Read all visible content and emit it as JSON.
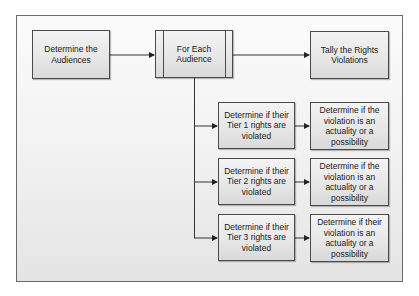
{
  "diagram": {
    "type": "flowchart",
    "nodes": [
      {
        "id": "determine_audiences",
        "label": "Determine the Audiences",
        "shape": "process"
      },
      {
        "id": "for_each_audience",
        "label": "For Each Audience",
        "shape": "predefined-process"
      },
      {
        "id": "tally_violations",
        "label": "Tally the Rights Violations",
        "shape": "process"
      },
      {
        "id": "tier1",
        "label": "Determine if their Tier 1 rights are violated",
        "shape": "process"
      },
      {
        "id": "tier1_actuality",
        "label": "Determine if the violation is an actuality or a possibility",
        "shape": "process"
      },
      {
        "id": "tier2",
        "label": "Determine if their Tier 2 rights are violated",
        "shape": "process"
      },
      {
        "id": "tier2_actuality",
        "label": "Determine if the violation is an actuality or a possibility",
        "shape": "process"
      },
      {
        "id": "tier3",
        "label": "Determine if their Tier 3 rights are violated",
        "shape": "process"
      },
      {
        "id": "tier3_actuality",
        "label": "Determine if their violation is an actuality or a possibility",
        "shape": "process"
      }
    ],
    "edges": [
      {
        "from": "determine_audiences",
        "to": "for_each_audience"
      },
      {
        "from": "for_each_audience",
        "to": "tally_violations"
      },
      {
        "from": "for_each_audience",
        "to": "tier1"
      },
      {
        "from": "for_each_audience",
        "to": "tier2"
      },
      {
        "from": "for_each_audience",
        "to": "tier3"
      },
      {
        "from": "tier1",
        "to": "tier1_actuality"
      },
      {
        "from": "tier2",
        "to": "tier2_actuality"
      },
      {
        "from": "tier3",
        "to": "tier3_actuality"
      }
    ]
  },
  "boxes": {
    "determine_audiences": {
      "lines": [
        "Determine the",
        "Audiences"
      ]
    },
    "for_each_audience": {
      "lines": [
        "For Each",
        "Audience"
      ]
    },
    "tally_violations": {
      "lines": [
        "Tally the Rights",
        "Violations"
      ]
    },
    "tier1": {
      "lines": [
        "Determine if their",
        "Tier 1 rights are",
        "violated"
      ]
    },
    "tier1_actuality": {
      "lines": [
        "Determine if the",
        "violation is an",
        "actuality or a",
        "possibility"
      ]
    },
    "tier2": {
      "lines": [
        "Determine if their",
        "Tier 2 rights are",
        "violated"
      ]
    },
    "tier2_actuality": {
      "lines": [
        "Determine if the",
        "violation is an",
        "actuality or a",
        "possibility"
      ]
    },
    "tier3": {
      "lines": [
        "Determine if their",
        "Tier 3 rights are",
        "violated"
      ]
    },
    "tier3_actuality": {
      "lines": [
        "Determine if their",
        "violation is an",
        "actuality or a",
        "possibility"
      ]
    }
  },
  "colors": {
    "box_border": "#4a4a4a",
    "connector": "#333333",
    "text": "#1a1a1a",
    "frame_border": "#6a6a6a"
  }
}
